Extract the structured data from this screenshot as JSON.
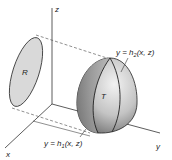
{
  "diagram": {
    "axes": {
      "x_label": "x",
      "y_label": "y",
      "z_label": "z"
    },
    "region": {
      "label": "R",
      "fill": "#d9d9d9",
      "stroke": "#333333"
    },
    "solid": {
      "label": "T",
      "fill_light": "#e6e6e6",
      "fill_dark": "#8a8a8a",
      "stroke": "#222222"
    },
    "surfaces": {
      "upper": {
        "prefix": "y = h",
        "subscript": "2",
        "suffix": "(x, z)"
      },
      "lower": {
        "prefix": "y = h",
        "subscript": "1",
        "suffix": "(x, z)"
      }
    },
    "colors": {
      "axis": "#333333",
      "dashed": "#444444"
    }
  }
}
